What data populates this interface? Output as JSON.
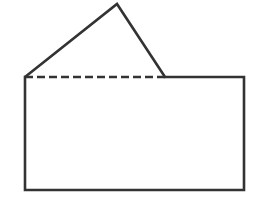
{
  "diagram": {
    "stroke_color": "#333333",
    "background_color": "#ffffff",
    "stroke_width": 2.6,
    "dash_pattern": "8 4",
    "shapes": {
      "rectangle": {
        "x": 25,
        "y": 77,
        "width": 219,
        "height": 113
      },
      "triangle": {
        "apex": [
          117,
          4
        ],
        "base_left": [
          25,
          77
        ],
        "base_right": [
          165,
          77
        ]
      },
      "dashed_base": {
        "x1": 25,
        "y1": 77,
        "x2": 165,
        "y2": 77
      }
    }
  }
}
